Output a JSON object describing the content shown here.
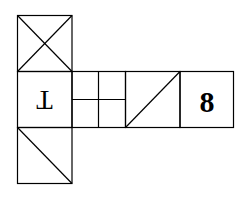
{
  "diagram": {
    "type": "cube-net",
    "stroke_color": "#000000",
    "background": "#ffffff",
    "faces": [
      {
        "id": "top",
        "pattern": "x-cross",
        "label": ""
      },
      {
        "id": "left",
        "pattern": "letter",
        "label": "T",
        "rotation": 180
      },
      {
        "id": "center",
        "pattern": "quad-grid",
        "label": ""
      },
      {
        "id": "right",
        "pattern": "diagonal-up",
        "label": ""
      },
      {
        "id": "far-right",
        "pattern": "number",
        "label": "8"
      },
      {
        "id": "bottom",
        "pattern": "diagonal-down",
        "label": ""
      }
    ]
  }
}
